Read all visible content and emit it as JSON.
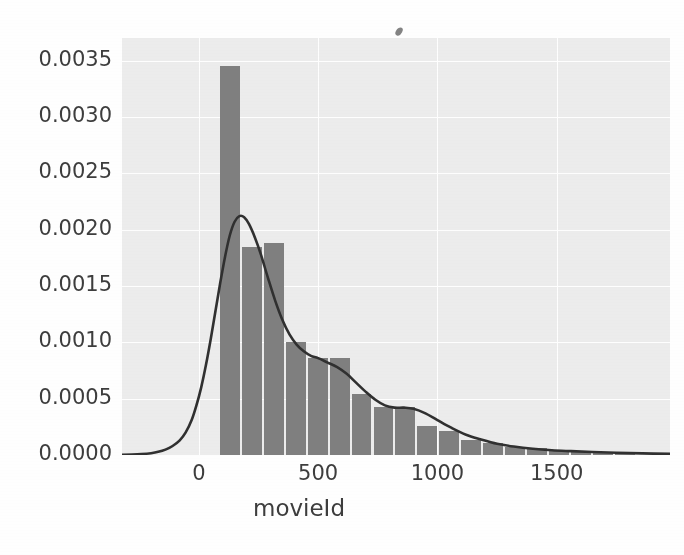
{
  "chart_data": {
    "type": "bar",
    "title": "",
    "xlabel": "movieId",
    "ylabel": "",
    "xlim": [
      -322,
      1975
    ],
    "ylim": [
      0.0,
      0.0037
    ],
    "grid": true,
    "legend": "none",
    "xticks": [
      "0",
      "500",
      "1000",
      "1500"
    ],
    "xtick_values": [
      0,
      500,
      1000,
      1500
    ],
    "yticks": [
      "0.0000",
      "0.0005",
      "0.0010",
      "0.0015",
      "0.0020",
      "0.0025",
      "0.0030",
      "0.0035"
    ],
    "ytick_values": [
      0.0,
      0.0005,
      0.001,
      0.0015,
      0.002,
      0.0025,
      0.003,
      0.0035
    ],
    "bar_color": "#808080",
    "kde_color": "#303030",
    "plot_background": "#ededed",
    "figure_background": "#ffffff",
    "bin_width": 92,
    "bins": [
      {
        "x0": -8,
        "x1": 84,
        "density": 0.0
      },
      {
        "x0": 84,
        "x1": 176,
        "density": 0.00345
      },
      {
        "x0": 176,
        "x1": 268,
        "density": 0.00185
      },
      {
        "x0": 268,
        "x1": 360,
        "density": 0.00188
      },
      {
        "x0": 360,
        "x1": 452,
        "density": 0.001
      },
      {
        "x0": 452,
        "x1": 544,
        "density": 0.00086
      },
      {
        "x0": 544,
        "x1": 636,
        "density": 0.00086
      },
      {
        "x0": 636,
        "x1": 728,
        "density": 0.00054
      },
      {
        "x0": 728,
        "x1": 820,
        "density": 0.00043
      },
      {
        "x0": 820,
        "x1": 912,
        "density": 0.00043
      },
      {
        "x0": 912,
        "x1": 1004,
        "density": 0.00026
      },
      {
        "x0": 1004,
        "x1": 1096,
        "density": 0.00021
      },
      {
        "x0": 1096,
        "x1": 1188,
        "density": 0.00013
      },
      {
        "x0": 1188,
        "x1": 1280,
        "density": 0.00011
      },
      {
        "x0": 1280,
        "x1": 1372,
        "density": 7e-05
      },
      {
        "x0": 1372,
        "x1": 1464,
        "density": 6e-05
      },
      {
        "x0": 1464,
        "x1": 1556,
        "density": 4e-05
      },
      {
        "x0": 1556,
        "x1": 1648,
        "density": 3e-05
      },
      {
        "x0": 1648,
        "x1": 1740,
        "density": 2e-05
      },
      {
        "x0": 1740,
        "x1": 1832,
        "density": 2e-05
      }
    ],
    "kde": {
      "name": "density-curve",
      "x": [
        -322,
        -280,
        -240,
        -200,
        -170,
        -140,
        -110,
        -80,
        -55,
        -30,
        -10,
        10,
        30,
        50,
        70,
        90,
        110,
        130,
        150,
        170,
        190,
        210,
        235,
        260,
        290,
        320,
        350,
        380,
        410,
        440,
        470,
        500,
        540,
        580,
        620,
        660,
        700,
        740,
        780,
        820,
        860,
        900,
        950,
        1000,
        1060,
        1120,
        1180,
        1250,
        1320,
        1400,
        1480,
        1560,
        1650,
        1750,
        1860,
        1975
      ],
      "y": [
        2e-06,
        4e-06,
        8e-06,
        1.6e-05,
        2.8e-05,
        4.8e-05,
        8e-05,
        0.00013,
        0.0002,
        0.00031,
        0.00044,
        0.0006,
        0.0008,
        0.00103,
        0.00128,
        0.00153,
        0.00176,
        0.00195,
        0.00207,
        0.00212,
        0.00211,
        0.00205,
        0.00193,
        0.00178,
        0.00157,
        0.00137,
        0.0012,
        0.00107,
        0.00098,
        0.00092,
        0.00088,
        0.00086,
        0.00082,
        0.00078,
        0.00072,
        0.00064,
        0.00056,
        0.00049,
        0.00044,
        0.00042,
        0.00042,
        0.00041,
        0.00037,
        0.00031,
        0.00024,
        0.00018,
        0.00014,
        0.0001,
        7.5e-05,
        5.5e-05,
        4.2e-05,
        3.4e-05,
        2.6e-05,
        2e-05,
        1.4e-05,
        1e-05
      ]
    }
  },
  "axes": {
    "x_label": "movieId"
  },
  "artifacts": {
    "smudge": "scan-artifact"
  }
}
